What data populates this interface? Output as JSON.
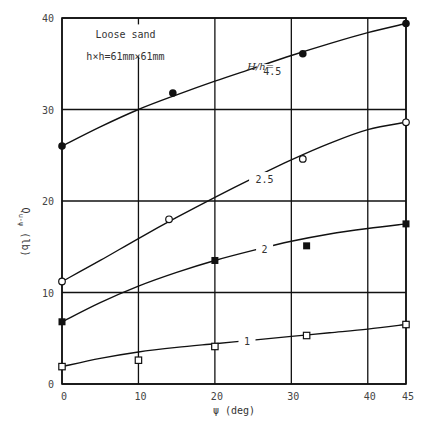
{
  "chart_data": {
    "type": "line",
    "title": "",
    "xlabel": "ψ (deg)",
    "ylabel": "Q_u-ψ (lb)",
    "xlim": [
      0,
      45
    ],
    "ylim": [
      0,
      40
    ],
    "x_ticks": [
      0,
      10,
      20,
      30,
      40,
      45
    ],
    "y_ticks": [
      0,
      10,
      20,
      30,
      40
    ],
    "grid": true,
    "annotations": [
      {
        "text": "Loose sand",
        "x": 7,
        "y": 38.2
      },
      {
        "text": "h×h=61mm×61mm",
        "x": 7,
        "y": 35.8
      },
      {
        "text": "H/h=",
        "x": 26,
        "y": 34.7
      }
    ],
    "legend_position": "inline labels on curves",
    "series": [
      {
        "name": "H/h = 4.5",
        "curve_label": "4.5",
        "marker": "filled-circle",
        "points": [
          [
            0,
            26.0
          ],
          [
            14.5,
            31.8
          ],
          [
            31.5,
            36.1
          ],
          [
            45,
            39.4
          ]
        ],
        "fit_curve": [
          [
            0,
            26.0
          ],
          [
            5,
            28.1
          ],
          [
            10,
            30.0
          ],
          [
            15,
            31.6
          ],
          [
            20,
            33.1
          ],
          [
            25,
            34.5
          ],
          [
            30,
            35.9
          ],
          [
            35,
            37.2
          ],
          [
            40,
            38.4
          ],
          [
            45,
            39.4
          ]
        ]
      },
      {
        "name": "H/h = 2.5",
        "curve_label": "2.5",
        "marker": "open-circle",
        "points": [
          [
            0,
            11.2
          ],
          [
            14,
            18.0
          ],
          [
            31.5,
            24.6
          ],
          [
            45,
            28.6
          ]
        ],
        "fit_curve": [
          [
            0,
            11.2
          ],
          [
            5,
            13.5
          ],
          [
            10,
            15.9
          ],
          [
            15,
            18.2
          ],
          [
            20,
            20.4
          ],
          [
            25,
            22.5
          ],
          [
            30,
            24.5
          ],
          [
            35,
            26.3
          ],
          [
            40,
            27.8
          ],
          [
            45,
            28.6
          ]
        ]
      },
      {
        "name": "H/h = 2",
        "curve_label": "2",
        "marker": "filled-square",
        "points": [
          [
            0,
            6.8
          ],
          [
            20,
            13.5
          ],
          [
            32,
            15.1
          ],
          [
            45,
            17.5
          ]
        ],
        "fit_curve": [
          [
            0,
            6.8
          ],
          [
            5,
            8.9
          ],
          [
            10,
            10.7
          ],
          [
            15,
            12.2
          ],
          [
            20,
            13.5
          ],
          [
            25,
            14.6
          ],
          [
            30,
            15.6
          ],
          [
            35,
            16.4
          ],
          [
            40,
            17.0
          ],
          [
            45,
            17.5
          ]
        ]
      },
      {
        "name": "H/h = 1",
        "curve_label": "1",
        "marker": "open-square",
        "points": [
          [
            0,
            1.9
          ],
          [
            10,
            2.6
          ],
          [
            20,
            4.1
          ],
          [
            32,
            5.3
          ],
          [
            45,
            6.5
          ]
        ],
        "fit_curve": [
          [
            0,
            1.9
          ],
          [
            5,
            2.8
          ],
          [
            10,
            3.5
          ],
          [
            15,
            4.0
          ],
          [
            20,
            4.4
          ],
          [
            25,
            4.8
          ],
          [
            30,
            5.2
          ],
          [
            35,
            5.6
          ],
          [
            40,
            6.0
          ],
          [
            45,
            6.5
          ]
        ]
      }
    ]
  }
}
